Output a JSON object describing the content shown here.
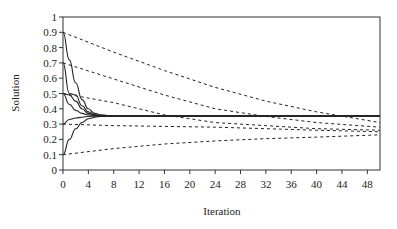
{
  "chart_data": {
    "type": "line",
    "title": "",
    "xlabel": "Iteration",
    "ylabel": "Solution",
    "xlim": [
      0,
      50
    ],
    "ylim": [
      0,
      1
    ],
    "x_ticks": [
      0,
      4,
      8,
      12,
      16,
      20,
      24,
      28,
      32,
      36,
      40,
      44,
      48
    ],
    "y_ticks": [
      0,
      0.1,
      0.2,
      0.3,
      0.4,
      0.5,
      0.6,
      0.7,
      0.8,
      0.9,
      1
    ],
    "y_tick_labels": [
      "0",
      "0.1",
      "0.2",
      "0.3",
      "0.4",
      "0.5",
      "0.6",
      "0.7",
      "0.8",
      "0.9",
      "1"
    ],
    "grid": false,
    "legend": null,
    "series": [
      {
        "name": "fast from 0.9",
        "style": "solid",
        "x": [
          0,
          1,
          2,
          3,
          4,
          5,
          6,
          8,
          50
        ],
        "values": [
          0.9,
          0.72,
          0.57,
          0.46,
          0.4,
          0.37,
          0.36,
          0.353,
          0.353
        ]
      },
      {
        "name": "fast from 0.7",
        "style": "solid",
        "x": [
          0,
          1,
          2,
          3,
          4,
          5,
          6,
          8,
          50
        ],
        "values": [
          0.7,
          0.5,
          0.49,
          0.42,
          0.38,
          0.36,
          0.355,
          0.353,
          0.353
        ]
      },
      {
        "name": "fast from 0.5 (a)",
        "style": "solid",
        "x": [
          0,
          1,
          2,
          3,
          4,
          5,
          6,
          8,
          50
        ],
        "values": [
          0.5,
          0.49,
          0.45,
          0.4,
          0.37,
          0.36,
          0.355,
          0.353,
          0.353
        ]
      },
      {
        "name": "fast from 0.5 (b)",
        "style": "solid",
        "x": [
          0,
          1,
          2,
          3,
          4,
          5,
          6,
          8,
          50
        ],
        "values": [
          0.5,
          0.43,
          0.39,
          0.37,
          0.36,
          0.355,
          0.353,
          0.353,
          0.353
        ]
      },
      {
        "name": "fast from 0.3",
        "style": "solid",
        "x": [
          0,
          1,
          2,
          3,
          4,
          5,
          6,
          8,
          50
        ],
        "values": [
          0.3,
          0.33,
          0.34,
          0.345,
          0.35,
          0.352,
          0.353,
          0.353,
          0.353
        ]
      },
      {
        "name": "fast from 0.1",
        "style": "solid",
        "x": [
          0,
          1,
          2,
          3,
          4,
          5,
          6,
          8,
          50
        ],
        "values": [
          0.1,
          0.2,
          0.27,
          0.31,
          0.335,
          0.345,
          0.35,
          0.353,
          0.353
        ]
      },
      {
        "name": "slow from 0.9",
        "style": "dashed",
        "x": [
          0,
          8,
          16,
          24,
          32,
          40,
          50
        ],
        "values": [
          0.9,
          0.77,
          0.65,
          0.54,
          0.45,
          0.38,
          0.31
        ]
      },
      {
        "name": "slow from 0.7",
        "style": "dashed",
        "x": [
          0,
          8,
          16,
          24,
          32,
          40,
          50
        ],
        "values": [
          0.7,
          0.595,
          0.49,
          0.4,
          0.35,
          0.31,
          0.28
        ]
      },
      {
        "name": "slow from 0.5",
        "style": "dashed",
        "x": [
          0,
          8,
          16,
          24,
          32,
          40,
          50
        ],
        "values": [
          0.5,
          0.44,
          0.36,
          0.31,
          0.29,
          0.27,
          0.26
        ]
      },
      {
        "name": "slow from 0.3",
        "style": "dashed",
        "x": [
          0,
          8,
          16,
          24,
          32,
          40,
          50
        ],
        "values": [
          0.3,
          0.29,
          0.285,
          0.28,
          0.27,
          0.26,
          0.25
        ]
      },
      {
        "name": "slow from 0.1",
        "style": "dashed",
        "x": [
          0,
          8,
          16,
          24,
          32,
          40,
          50
        ],
        "values": [
          0.1,
          0.14,
          0.17,
          0.19,
          0.205,
          0.215,
          0.23
        ]
      }
    ]
  },
  "layout": {
    "plot_left": 63,
    "plot_right": 380,
    "plot_top": 17,
    "plot_bottom": 170,
    "x_max_iter": 50
  }
}
